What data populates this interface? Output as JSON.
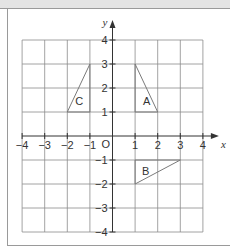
{
  "chart_data": {
    "type": "diagram",
    "title": "",
    "xlabel": "x",
    "ylabel": "y",
    "xlim": [
      -4,
      4
    ],
    "ylim": [
      -4,
      4
    ],
    "grid": true,
    "origin_label": "O",
    "x_ticks": [
      {
        "value": -4,
        "label": "−4"
      },
      {
        "value": -3,
        "label": "−3"
      },
      {
        "value": -2,
        "label": "−2"
      },
      {
        "value": -1,
        "label": "−1"
      },
      {
        "value": 1,
        "label": "1"
      },
      {
        "value": 2,
        "label": "2"
      },
      {
        "value": 3,
        "label": "3"
      },
      {
        "value": 4,
        "label": "4"
      }
    ],
    "y_ticks": [
      {
        "value": 4,
        "label": "4"
      },
      {
        "value": 3,
        "label": "3"
      },
      {
        "value": 2,
        "label": "2"
      },
      {
        "value": 1,
        "label": "1"
      },
      {
        "value": -1,
        "label": "−1"
      },
      {
        "value": -2,
        "label": "−2"
      },
      {
        "value": -3,
        "label": "−3"
      },
      {
        "value": -4,
        "label": "−4"
      }
    ],
    "shapes": [
      {
        "name": "A",
        "vertices": [
          [
            1,
            3
          ],
          [
            1,
            1
          ],
          [
            2,
            1
          ]
        ],
        "label_pos": [
          1.35,
          1.45
        ]
      },
      {
        "name": "B",
        "vertices": [
          [
            1,
            -1
          ],
          [
            3,
            -1
          ],
          [
            1,
            -2
          ]
        ],
        "label_pos": [
          1.3,
          -1.45
        ]
      },
      {
        "name": "C",
        "vertices": [
          [
            -1,
            3
          ],
          [
            -1,
            1
          ],
          [
            -2,
            1
          ]
        ],
        "label_pos": [
          -1.65,
          1.45
        ]
      }
    ]
  },
  "colors": {
    "grid": "#8c8c8c",
    "axis": "#333333",
    "shape_stroke": "#7a7a7a",
    "top_strip": "#e4e4e4"
  }
}
